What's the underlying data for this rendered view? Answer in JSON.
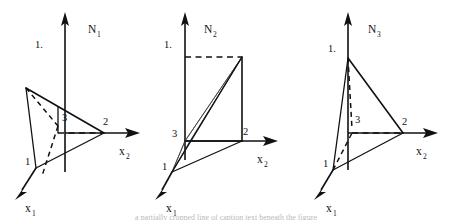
{
  "figure": {
    "background_color": "#ffffff",
    "line_color": "#111111",
    "shade_color": "#8a8a8a",
    "caption_partial": "a partially cropped line of caption text beneath the figure"
  },
  "panels": [
    {
      "id": "n1",
      "vertical_axis_label": "N",
      "vertical_axis_subscript": "1",
      "horizontal_axis_label": "x",
      "horizontal_axis_subscript": "2",
      "depth_axis_label": "x",
      "depth_axis_subscript": "1",
      "tick_label": "1.",
      "node_labels": [
        "1",
        "2",
        "3"
      ],
      "description": "Shape function N1 plane: peak value 1 at node 1, zero at nodes 2 and 3"
    },
    {
      "id": "n2",
      "vertical_axis_label": "N",
      "vertical_axis_subscript": "2",
      "horizontal_axis_label": "x",
      "horizontal_axis_subscript": "2",
      "depth_axis_label": "x",
      "depth_axis_subscript": "1",
      "tick_label": "1.",
      "node_labels": [
        "1",
        "2",
        "3"
      ],
      "shaded": true,
      "description": "Shape function N2 plane: peak value 1 at node 2, zero at nodes 1 and 3, shaded sliver"
    },
    {
      "id": "n3",
      "vertical_axis_label": "N",
      "vertical_axis_subscript": "3",
      "horizontal_axis_label": "x",
      "horizontal_axis_subscript": "2",
      "depth_axis_label": "x",
      "depth_axis_subscript": "1",
      "tick_label": "1.",
      "node_labels": [
        "1",
        "2",
        "3"
      ],
      "description": "Shape function N3 plane: peak value 1 at node 3, zero at nodes 1 and 2"
    }
  ]
}
